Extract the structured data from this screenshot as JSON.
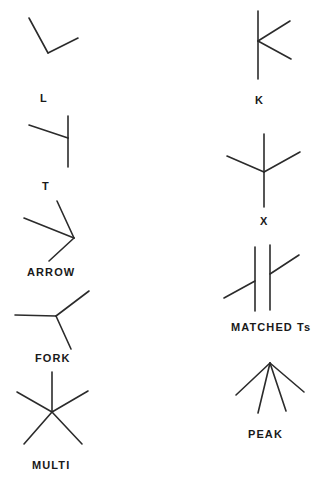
{
  "figure": {
    "background_color": "#ffffff",
    "stroke_color": "#2b2b2b",
    "label_color": "#1a1a1a",
    "stroke_width": 1.6,
    "width": 326,
    "height": 487,
    "type": "line-drawing-junction-taxonomy"
  },
  "junctions": [
    {
      "id": "l-junction",
      "label": "L",
      "column": "left",
      "label_x": 40,
      "label_y": 93,
      "vertex": [
        48,
        53
      ],
      "arms": [
        {
          "name": "upper-left-arm",
          "to": [
            29,
            18
          ]
        },
        {
          "name": "upper-right-arm",
          "to": [
            78,
            38
          ]
        }
      ]
    },
    {
      "id": "t-junction",
      "label": "T",
      "column": "left",
      "label_x": 42,
      "label_y": 181,
      "vertex": [
        68,
        138
      ],
      "arms": [
        {
          "name": "stem-up-arm",
          "to": [
            68,
            116
          ]
        },
        {
          "name": "stem-down-arm",
          "to": [
            68,
            167
          ]
        },
        {
          "name": "cross-left-arm",
          "to": [
            29,
            125
          ]
        }
      ]
    },
    {
      "id": "arrow-junction",
      "label": "ARROW",
      "column": "left",
      "label_x": 27,
      "label_y": 267,
      "vertex": [
        74,
        238
      ],
      "arms": [
        {
          "name": "upper-arm",
          "to": [
            57,
            201
          ]
        },
        {
          "name": "left-arm",
          "to": [
            24,
            218
          ]
        },
        {
          "name": "lower-arm",
          "to": [
            49,
            261
          ]
        }
      ]
    },
    {
      "id": "fork-junction",
      "label": "FORK",
      "column": "left",
      "label_x": 35,
      "label_y": 353,
      "vertex": [
        56,
        316
      ],
      "arms": [
        {
          "name": "left-arm",
          "to": [
            15,
            315
          ]
        },
        {
          "name": "upper-right-arm",
          "to": [
            89,
            291
          ]
        },
        {
          "name": "lower-right-arm",
          "to": [
            71,
            349
          ]
        }
      ]
    },
    {
      "id": "multi-junction",
      "label": "MULTI",
      "column": "left",
      "label_x": 32,
      "label_y": 460,
      "vertex": [
        52,
        412
      ],
      "arms": [
        {
          "name": "up-arm",
          "to": [
            52,
            372
          ]
        },
        {
          "name": "upper-left-arm",
          "to": [
            17,
            392
          ]
        },
        {
          "name": "upper-right-arm",
          "to": [
            88,
            391
          ]
        },
        {
          "name": "lower-left-arm",
          "to": [
            24,
            444
          ]
        },
        {
          "name": "lower-right-arm",
          "to": [
            82,
            444
          ]
        }
      ]
    },
    {
      "id": "k-junction",
      "label": "K",
      "column": "right",
      "label_x": 255,
      "label_y": 95,
      "vertex": [
        258,
        41
      ],
      "arms": [
        {
          "name": "stem-up-arm",
          "to": [
            258,
            11
          ]
        },
        {
          "name": "stem-down-arm",
          "to": [
            258,
            79
          ]
        },
        {
          "name": "upper-right-arm",
          "to": [
            290,
            21
          ]
        },
        {
          "name": "lower-right-arm",
          "to": [
            291,
            59
          ]
        }
      ]
    },
    {
      "id": "x-junction",
      "label": "X",
      "column": "right",
      "label_x": 260,
      "label_y": 216,
      "vertex": [
        264,
        172
      ],
      "arms": [
        {
          "name": "up-arm",
          "to": [
            264,
            134
          ]
        },
        {
          "name": "down-arm",
          "to": [
            264,
            207
          ]
        },
        {
          "name": "upper-left-arm",
          "to": [
            227,
            156
          ]
        },
        {
          "name": "upper-right-arm",
          "to": [
            300,
            152
          ]
        }
      ]
    },
    {
      "id": "matched-ts-junction",
      "label": "MATCHED Ts",
      "column": "right",
      "label_x": 231,
      "label_y": 322,
      "vertical_bars": [
        {
          "name": "left-bar",
          "x": 255,
          "y1": 247,
          "y2": 311
        },
        {
          "name": "right-bar",
          "x": 270,
          "y1": 245,
          "y2": 310
        }
      ],
      "diagonal_segments": [
        {
          "name": "lower-left-segment",
          "from": [
            224,
            298
          ],
          "to": [
            255,
            281
          ]
        },
        {
          "name": "upper-right-segment",
          "from": [
            270,
            274
          ],
          "to": [
            299,
            255
          ]
        }
      ]
    },
    {
      "id": "peak-junction",
      "label": "PEAK",
      "column": "right",
      "label_x": 248,
      "label_y": 429,
      "vertex": [
        270,
        363
      ],
      "arms": [
        {
          "name": "far-left-arm",
          "to": [
            236,
            395
          ]
        },
        {
          "name": "left-center-arm",
          "to": [
            258,
            413
          ]
        },
        {
          "name": "right-center-arm",
          "to": [
            286,
            411
          ]
        },
        {
          "name": "far-right-arm",
          "to": [
            304,
            392
          ]
        }
      ]
    }
  ]
}
